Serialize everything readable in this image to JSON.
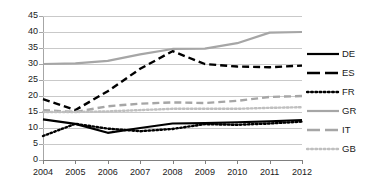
{
  "chart_data": {
    "type": "line",
    "title": "",
    "subtitle": "",
    "xlabel": "",
    "ylabel": "",
    "x": [
      2004,
      2005,
      2006,
      2007,
      2008,
      2009,
      2010,
      2011,
      2012
    ],
    "categories": [
      "2004",
      "2005",
      "2006",
      "2007",
      "2008",
      "2009",
      "2010",
      "2011",
      "2012"
    ],
    "ylim": [
      0,
      45
    ],
    "xlim": [
      2004,
      2012
    ],
    "ytick_labels": [
      "0",
      "5",
      "10",
      "15",
      "20",
      "25",
      "30",
      "35",
      "40",
      "45"
    ],
    "ytick_values": [
      0,
      5,
      10,
      15,
      20,
      25,
      30,
      35,
      40,
      45
    ],
    "grid": true,
    "grid_axis": "y",
    "legend_position": "right",
    "series": [
      {
        "name": "DE",
        "label": "DE",
        "color": "#000000",
        "style": "solid",
        "values": [
          12.7,
          11.3,
          8.5,
          10.0,
          11.4,
          11.5,
          11.8,
          12.1,
          12.5
        ]
      },
      {
        "name": "ES",
        "label": "ES",
        "color": "#000000",
        "style": "dashed",
        "values": [
          19.0,
          15.6,
          21.5,
          28.5,
          34.0,
          30.0,
          29.2,
          29.0,
          29.5
        ]
      },
      {
        "name": "FR",
        "label": "FR",
        "color": "#000000",
        "style": "dotted",
        "values": [
          7.5,
          11.3,
          9.8,
          9.0,
          9.7,
          11.2,
          11.0,
          11.4,
          12.0
        ]
      },
      {
        "name": "GR",
        "label": "GR",
        "color": "#a6a6a6",
        "style": "solid",
        "values": [
          30.0,
          30.2,
          31.0,
          33.0,
          34.7,
          34.8,
          36.5,
          39.8,
          40.0
        ]
      },
      {
        "name": "IT",
        "label": "IT",
        "color": "#a6a6a6",
        "style": "dashed",
        "values": [
          15.6,
          15.0,
          16.8,
          17.6,
          18.0,
          17.8,
          18.5,
          19.7,
          20.0
        ]
      },
      {
        "name": "GB",
        "label": "GB",
        "color": "#bfbfbf",
        "style": "dotted",
        "values": [
          15.0,
          15.0,
          15.2,
          15.6,
          16.0,
          16.0,
          16.0,
          16.3,
          16.5
        ]
      }
    ]
  }
}
